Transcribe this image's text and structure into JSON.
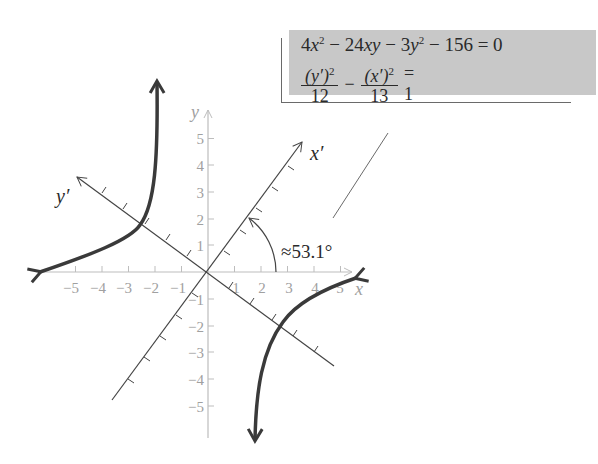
{
  "equations": {
    "line1": {
      "c1": "4",
      "v1": "x",
      "p1": "2",
      "op1": " − 24",
      "v2": "xy",
      "op2": " − 3",
      "v3": "y",
      "p3": "2",
      "rest": " − 156 = 0"
    },
    "line2": {
      "num1_var": "(y′)",
      "num1_pow": "2",
      "den1": "12",
      "minus": "−",
      "num2_var": "(x′)",
      "num2_pow": "2",
      "den2": "13",
      "equals": "= 1"
    }
  },
  "axes": {
    "x_label": "x",
    "y_label": "y",
    "x_prime_label": "x′",
    "y_prime_label": "y′",
    "x_ticks": [
      "−5",
      "−4",
      "−3",
      "−2",
      "−1",
      "1",
      "2",
      "3",
      "4",
      "5"
    ],
    "y_ticks": [
      "5",
      "4",
      "3",
      "2",
      "1",
      "−1",
      "−2",
      "−3",
      "−4",
      "−5"
    ]
  },
  "angle_label": "≈53.1°",
  "colors": {
    "box": "#c8c8c8",
    "axes": "#bdbdbd",
    "rotated_axes": "#444444",
    "curve": "#3a3a3a",
    "text": "#2a2a2a",
    "tick_text": "#a0a0a0"
  }
}
